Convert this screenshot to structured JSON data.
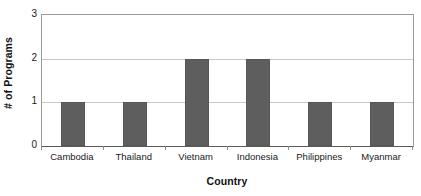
{
  "chart_data": {
    "type": "bar",
    "title": "",
    "categories": [
      "Cambodia",
      "Thailand",
      "Vietnam",
      "Indonesia",
      "Philippines",
      "Myanmar"
    ],
    "values": [
      1,
      1,
      2,
      2,
      1,
      1
    ],
    "xlabel": "Country",
    "ylabel": "# of Programs",
    "ylim": [
      0,
      3
    ],
    "yticks": [
      "0",
      "1",
      "2",
      "3"
    ],
    "ytick_values": [
      0,
      1,
      2,
      3
    ],
    "grid": "horizontal",
    "legend": "none",
    "bar_color": "#5e5e5e",
    "gridline_color": "#c8c8c8",
    "axis_color": "#9a9a9a",
    "background_color": "#ffffff"
  }
}
